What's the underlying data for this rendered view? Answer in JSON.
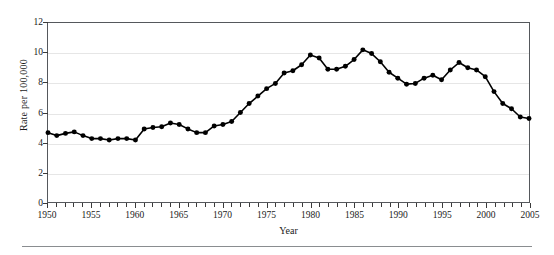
{
  "chart_data": {
    "type": "line",
    "title": "",
    "xlabel": "Year",
    "ylabel": "Rate per 100,000",
    "xlim": [
      1950,
      2005
    ],
    "ylim": [
      0,
      12
    ],
    "ytick_labels": [
      "0",
      "2",
      "4",
      "6",
      "8",
      "10",
      "12"
    ],
    "ytick_values": [
      0,
      2,
      4,
      6,
      8,
      10,
      12
    ],
    "xtick_labels": [
      "1950",
      "1955",
      "1960",
      "1965",
      "1970",
      "1975",
      "1980",
      "1985",
      "1990",
      "1995",
      "2000",
      "2005"
    ],
    "xtick_values": [
      1950,
      1955,
      1960,
      1965,
      1970,
      1975,
      1980,
      1985,
      1990,
      1995,
      2000,
      2005
    ],
    "grid": "horizontal",
    "legend": "none",
    "marker": "filled-circle",
    "line_color": "#000000",
    "marker_color": "#000000",
    "grid_color": "#e6e6e6",
    "frame_color": "#55585c",
    "x": [
      1950,
      1951,
      1952,
      1953,
      1954,
      1955,
      1956,
      1957,
      1958,
      1959,
      1960,
      1961,
      1962,
      1963,
      1964,
      1965,
      1966,
      1967,
      1968,
      1969,
      1970,
      1971,
      1972,
      1973,
      1974,
      1975,
      1976,
      1977,
      1978,
      1979,
      1980,
      1981,
      1982,
      1983,
      1984,
      1985,
      1986,
      1987,
      1988,
      1989,
      1990,
      1991,
      1992,
      1993,
      1994,
      1995,
      1996,
      1997,
      1998,
      1999,
      2000,
      2001,
      2002,
      2003,
      2004,
      2005
    ],
    "values": [
      4.65,
      4.45,
      4.6,
      4.7,
      4.45,
      4.25,
      4.25,
      4.15,
      4.25,
      4.25,
      4.15,
      4.9,
      5.0,
      5.05,
      5.3,
      5.2,
      4.9,
      4.65,
      4.65,
      5.1,
      5.2,
      5.4,
      6.0,
      6.6,
      7.1,
      7.6,
      7.95,
      8.65,
      8.8,
      9.2,
      9.85,
      9.65,
      8.9,
      8.9,
      9.1,
      9.55,
      10.2,
      9.95,
      9.4,
      8.7,
      8.3,
      7.9,
      7.95,
      8.3,
      8.5,
      8.2,
      8.85,
      9.35,
      9.0,
      8.85,
      8.4,
      7.4,
      6.6,
      6.25,
      5.7,
      5.6
    ],
    "data_note": "Yearly rate per 100,000 population, 1950 through 2005"
  },
  "axis": {
    "y_title": "Rate per 100,000",
    "x_title": "Year"
  }
}
